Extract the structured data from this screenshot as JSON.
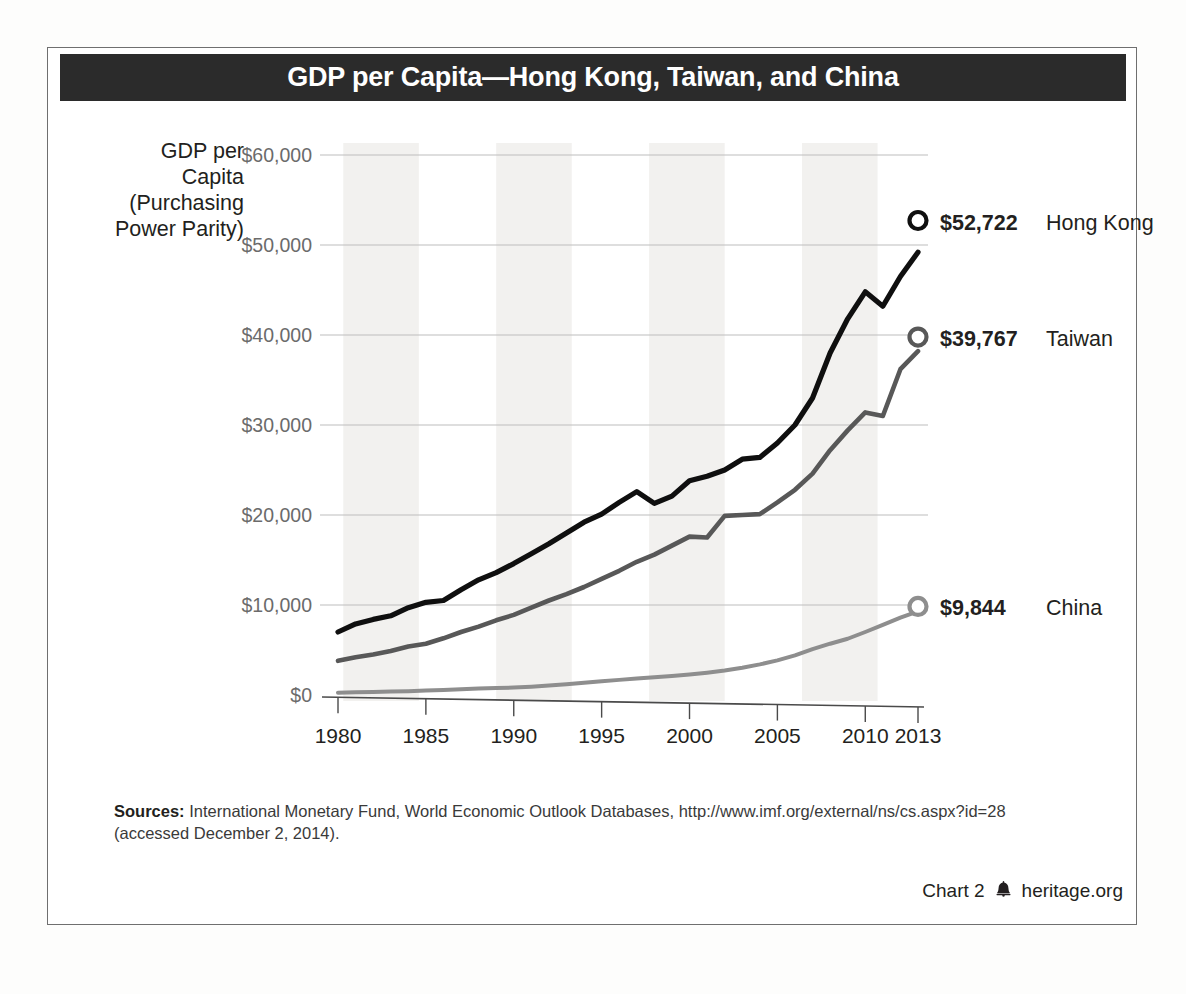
{
  "title": "GDP per Capita—Hong Kong, Taiwan, and China",
  "axis_title_lines": [
    "GDP per",
    "Capita",
    "(Purchasing",
    "Power Parity)"
  ],
  "sources": {
    "label": "Sources:",
    "line1": " International Monetary Fund, World Economic Outlook Databases, http://www.imf.org/external/ns/cs.aspx?id=28",
    "line2": "(accessed December 2, 2014)."
  },
  "footer": {
    "chart_number": "Chart 2",
    "bell_icon": "liberty-bell-icon",
    "site": "heritage.org"
  },
  "colors": {
    "banner": "#2b2b2b",
    "hong_kong": "#0f0f0f",
    "taiwan": "#585858",
    "china": "#8e8e8e",
    "gridline": "#bdbdbd",
    "axis": "#4a4a4a",
    "band": "#f2f1ef",
    "tick_label": "#6b6b6b"
  },
  "chart_data": {
    "type": "line",
    "title": "GDP per Capita—Hong Kong, Taiwan, and China",
    "xlabel": "",
    "ylabel": "GDP per Capita (Purchasing Power Parity)",
    "xlim": [
      1980,
      2013
    ],
    "ylim": [
      0,
      60000
    ],
    "grid": true,
    "legend_position": "right-end-labels",
    "xticks": [
      1980,
      1985,
      1990,
      1995,
      2000,
      2005,
      2010,
      2013
    ],
    "xtick_labels": [
      "1980",
      "1985",
      "1990",
      "1995",
      "2000",
      "2005",
      "2010",
      "2013"
    ],
    "yticks": [
      0,
      10000,
      20000,
      30000,
      40000,
      50000,
      60000
    ],
    "ytick_labels": [
      "$0",
      "$10,000",
      "$20,000",
      "$30,000",
      "$40,000",
      "$50,000",
      "$60,000"
    ],
    "x": [
      1980,
      1981,
      1982,
      1983,
      1984,
      1985,
      1986,
      1987,
      1988,
      1989,
      1990,
      1991,
      1992,
      1993,
      1994,
      1995,
      1996,
      1997,
      1998,
      1999,
      2000,
      2001,
      2002,
      2003,
      2004,
      2005,
      2006,
      2007,
      2008,
      2009,
      2010,
      2011,
      2012,
      2013
    ],
    "series": [
      {
        "name": "Hong Kong",
        "color": "#0f0f0f",
        "end_label": "$52,722",
        "end_value": 52722,
        "marker": "open-circle",
        "values": [
          7000,
          7900,
          8400,
          8800,
          9700,
          10300,
          10500,
          11700,
          12800,
          13600,
          14600,
          15700,
          16800,
          18000,
          19200,
          20100,
          21400,
          22600,
          21300,
          22100,
          23800,
          24300,
          25000,
          26200,
          26400,
          28000,
          30000,
          33000,
          38000,
          41800,
          44800,
          43200,
          46500,
          49200
        ],
        "values_note": "read from gridlines; 2013 labeled $52,722"
      },
      {
        "name": "Taiwan",
        "color": "#585858",
        "end_label": "$39,767",
        "end_value": 39767,
        "marker": "open-circle",
        "values": [
          3800,
          4200,
          4500,
          4900,
          5400,
          5700,
          6300,
          7000,
          7600,
          8300,
          8900,
          9700,
          10500,
          11200,
          12000,
          12900,
          13800,
          14800,
          15600,
          16600,
          17600,
          17500,
          19900,
          20000,
          20100,
          21400,
          22800,
          24600,
          27200,
          29400,
          31400,
          31000,
          36200,
          38200
        ],
        "values_note": "read from gridlines; 2013 labeled $39,767"
      },
      {
        "name": "China",
        "color": "#8e8e8e",
        "end_label": "$9,844",
        "end_value": 9844,
        "marker": "open-circle",
        "values": [
          260,
          300,
          340,
          380,
          430,
          500,
          560,
          640,
          720,
          780,
          830,
          920,
          1050,
          1200,
          1360,
          1520,
          1680,
          1830,
          1960,
          2100,
          2280,
          2480,
          2720,
          3020,
          3400,
          3850,
          4400,
          5100,
          5700,
          6250,
          7000,
          7800,
          8600,
          9300
        ],
        "values_note": "read from gridlines; 2013 labeled $9,844"
      }
    ],
    "shaded_bands": [
      {
        "start": 1980.3,
        "end": 1984.6
      },
      {
        "start": 1989.0,
        "end": 1993.3
      },
      {
        "start": 1997.7,
        "end": 2002.0
      },
      {
        "start": 2006.4,
        "end": 2010.7
      }
    ],
    "annotations": [
      {
        "text": "$52,722 Hong Kong",
        "at_year": 2013,
        "at_value": 52722
      },
      {
        "text": "$39,767 Taiwan",
        "at_year": 2013,
        "at_value": 39767
      },
      {
        "text": "$9,844 China",
        "at_year": 2013,
        "at_value": 9844
      }
    ]
  }
}
